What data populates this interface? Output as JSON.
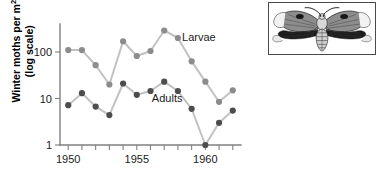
{
  "chart_data": {
    "type": "line",
    "title": "",
    "xlabel": "",
    "ylabel": "Winter moths per m2 (log scale)",
    "ylabel_line1": "Winter moths per m",
    "ylabel_exponent": "2",
    "ylabel_line2": "(log scale)",
    "yscale": "log",
    "ylim": [
      1,
      400
    ],
    "ytick_values": [
      1,
      10,
      100
    ],
    "ytick_labels": [
      "1",
      "10",
      "100"
    ],
    "xlim": [
      1949.4,
      1962.6
    ],
    "x": [
      1950,
      1951,
      1952,
      1953,
      1954,
      1955,
      1956,
      1957,
      1958,
      1959,
      1960,
      1961,
      1962
    ],
    "xtick_values": [
      1950,
      1951,
      1952,
      1953,
      1954,
      1955,
      1956,
      1957,
      1958,
      1959,
      1960,
      1961,
      1962
    ],
    "xtick_labeled": [
      1950,
      1955,
      1960
    ],
    "xtick_labels": [
      "1950",
      "1955",
      "1960"
    ],
    "grid": false,
    "legend_position": "inline-annotation",
    "series": [
      {
        "name": "Larvae",
        "label": "Larvae",
        "color": "#8c8c8c",
        "line_color": "#c2c2c2",
        "values": [
          110,
          110,
          52,
          20,
          170,
          82,
          105,
          290,
          200,
          63,
          23,
          8.5,
          15
        ]
      },
      {
        "name": "Adults",
        "label": "Adults",
        "color": "#4d4d4d",
        "line_color": "#c2c2c2",
        "values": [
          7.2,
          13,
          6.7,
          4.4,
          21,
          12,
          14.5,
          23,
          14.5,
          6,
          1,
          3,
          5.5
        ]
      }
    ],
    "annotations": [
      {
        "text": "Larvae",
        "x": 1958.3,
        "y": 175,
        "name": "larvae-series-label"
      },
      {
        "text": "Adults",
        "x": 1956.1,
        "y": 8.6,
        "name": "adults-series-label"
      }
    ]
  },
  "inset": {
    "name": "winter-moth-illustration",
    "caption": ""
  }
}
